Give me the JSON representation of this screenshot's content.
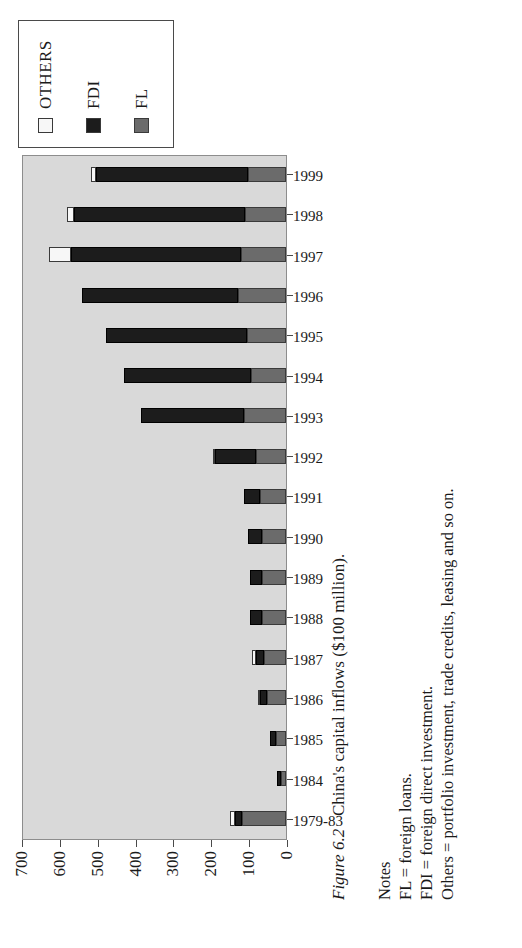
{
  "figure": {
    "label": "Figure 6.2",
    "caption": "China's capital inflows ($100 million)."
  },
  "notes": {
    "heading": "Notes",
    "lines": [
      "FL = foreign loans.",
      "FDI = foreign direct investment.",
      "Others = portfolio investment, trade credits, leasing and so on."
    ]
  },
  "legend": {
    "position": "top-right",
    "entries": [
      {
        "label": "OTHERS",
        "color": "#f7f7f7",
        "swatch": "others-swatch"
      },
      {
        "label": "FDI",
        "color": "#1c1c1c",
        "swatch": "fdi-swatch"
      },
      {
        "label": "FL",
        "color": "#6b6b6b",
        "swatch": "fl-swatch"
      }
    ]
  },
  "axis": {
    "y_ticks": [
      "0",
      "100",
      "200",
      "300",
      "400",
      "500",
      "600",
      "700"
    ],
    "y_min": 0,
    "y_max": 700,
    "y_step": 100
  },
  "chart_data": {
    "type": "bar",
    "orientation": "vertical-stacked",
    "title": "China's capital inflows ($100 million)",
    "xlabel": "",
    "ylabel": "",
    "ylim": [
      0,
      700
    ],
    "grid": false,
    "legend_position": "top-right",
    "categories": [
      "1979-83",
      "1984",
      "1985",
      "1986",
      "1987",
      "1988",
      "1989",
      "1990",
      "1991",
      "1992",
      "1993",
      "1994",
      "1995",
      "1996",
      "1997",
      "1998",
      "1999"
    ],
    "series": [
      {
        "name": "FL",
        "color": "#6b6b6b",
        "values": [
          117,
          13,
          26,
          50,
          58,
          65,
          63,
          65,
          69,
          79,
          111,
          93,
          103,
          127,
          120,
          110,
          102
        ]
      },
      {
        "name": "FDI",
        "color": "#1c1c1c",
        "values": [
          18,
          12,
          17,
          19,
          23,
          32,
          34,
          35,
          44,
          110,
          275,
          338,
          375,
          417,
          453,
          455,
          404
        ]
      },
      {
        "name": "OTHERS",
        "color": "#f7f7f7",
        "values": [
          13,
          0,
          0,
          6,
          9,
          0,
          0,
          0,
          0,
          5,
          0,
          0,
          0,
          0,
          57,
          19,
          14
        ]
      }
    ],
    "totals": [
      148,
      25,
      43,
      75,
      90,
      97,
      97,
      100,
      113,
      194,
      386,
      431,
      478,
      544,
      630,
      584,
      520
    ]
  }
}
